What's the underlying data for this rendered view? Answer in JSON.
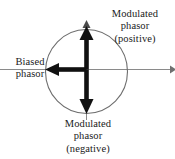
{
  "figure": {
    "type": "phasor-diagram",
    "background_color": "#ffffff",
    "stroke_color": "#1a1a1a",
    "thin_stroke_color": "#7a7a7a",
    "ellipse_color": "#6e6e6e"
  },
  "labels": {
    "biased_phasor": {
      "line1": "Biased",
      "line2": "phasor"
    },
    "modulated_positive": {
      "line1": "Modulated",
      "line2": "phasor",
      "line3": "(positive)"
    },
    "modulated_negative": {
      "line1": "Modulated",
      "line2": "phasor",
      "line3": "(negative)"
    }
  },
  "geometry": {
    "center_x": 86,
    "center_y": 69,
    "ellipse_rx": 41,
    "ellipse_ry": 42,
    "horizontal_axis_start_x": 0,
    "horizontal_axis_end_x": 172,
    "vertical_axis_top_y": 21,
    "vertical_axis_bottom_y": 120,
    "phasor_up_tip_y": 28,
    "phasor_down_tip_y": 113,
    "phasor_left_tip_x": 46
  }
}
